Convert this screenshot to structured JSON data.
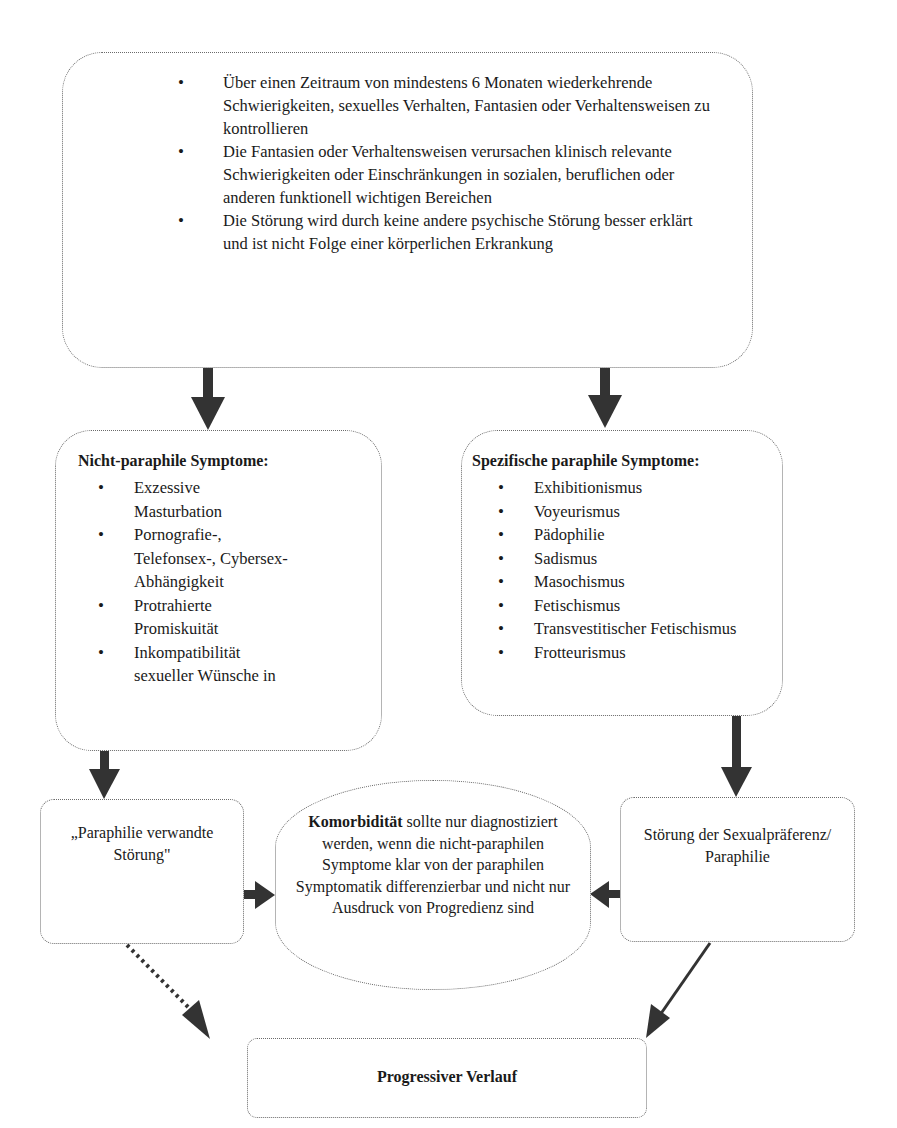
{
  "diagram": {
    "top_box": {
      "items": [
        "Über einen Zeitraum von mindestens 6 Monaten wiederkehrende Schwierigkeiten, sexuelles Verhalten, Fantasien oder Verhaltensweisen zu kontrollieren",
        "Die Fantasien oder Verhaltensweisen verursachen klinisch relevante Schwierigkeiten oder Einschränkungen in sozialen, beruflichen oder anderen funktionell wichtigen Bereichen",
        "Die Störung wird durch keine andere psychische Störung besser erklärt und ist nicht Folge einer körperlichen Erkrankung"
      ]
    },
    "non_paraphilic": {
      "title": "Nicht-paraphile Symptome:",
      "items": [
        "Exzessive Masturbation",
        "Pornografie-, Telefonsex-, Cybersex-Abhängigkeit",
        "Protrahierte Promiskuität",
        "Inkompatibilität sexueller Wünsche in"
      ]
    },
    "paraphilic": {
      "title": "Spezifische paraphile Symptome:",
      "items": [
        "Exhibitionismus",
        "Voyeurismus",
        "Pädophilie",
        "Sadismus",
        "Masochismus",
        "Fetischismus",
        "Transvestitischer Fetischismus",
        "Frotteurismus"
      ]
    },
    "related_disorder": {
      "label": "„Paraphilie verwandte Störung\""
    },
    "comorbidity": {
      "bold": "Komorbidität",
      "text": " sollte nur diagnostiziert werden, wenn die nicht-paraphilen Symptome klar von der paraphilen Symptomatik differenzierbar und nicht nur Ausdruck von Progredienz sind"
    },
    "paraphilia": {
      "label": "Störung der Sexualpräferenz/ Paraphilie"
    },
    "progressive": {
      "label": "Progressiver Verlauf"
    },
    "colors": {
      "border": "#6a6a6a",
      "arrow": "#333333",
      "text": "#1a1a1a"
    }
  }
}
